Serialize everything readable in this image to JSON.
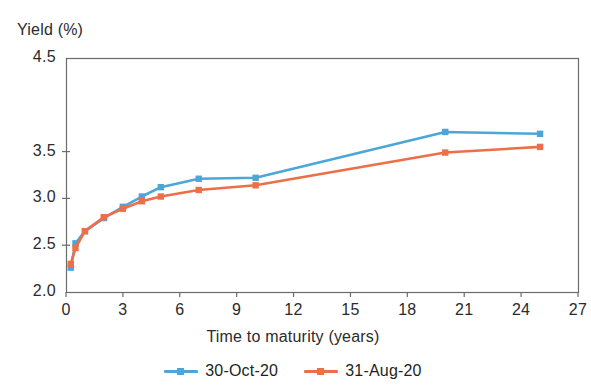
{
  "chart_data": {
    "type": "line",
    "title": "",
    "xlabel": "Time to maturity (years)",
    "ylabel": "Yield (%)",
    "xlim": [
      0,
      27
    ],
    "ylim": [
      2.0,
      4.5
    ],
    "grid": false,
    "legend_position": "bottom",
    "x_ticks": [
      "0",
      "3",
      "6",
      "9",
      "12",
      "15",
      "18",
      "21",
      "24",
      "27"
    ],
    "x_tick_values": [
      0,
      3,
      6,
      9,
      12,
      15,
      18,
      21,
      24,
      27
    ],
    "y_ticks": [
      "4.5",
      "3.5",
      "3.0",
      "2.5",
      "2.0"
    ],
    "y_tick_values": [
      4.5,
      3.5,
      3.0,
      2.5,
      2.0
    ],
    "x": [
      0.25,
      0.5,
      1,
      2,
      3,
      4,
      5,
      7,
      10,
      20,
      25
    ],
    "series": [
      {
        "name": "30-Oct-20",
        "color": "#4DA6D8",
        "marker": "square",
        "values": [
          2.26,
          2.52,
          2.65,
          2.79,
          2.91,
          3.02,
          3.12,
          3.21,
          3.22,
          3.71,
          3.69
        ]
      },
      {
        "name": "31-Aug-20",
        "color": "#ED6F47",
        "marker": "square",
        "values": [
          2.3,
          2.47,
          2.65,
          2.8,
          2.89,
          2.97,
          3.02,
          3.09,
          3.14,
          3.49,
          3.55
        ]
      }
    ]
  },
  "legend": {
    "items": [
      {
        "label": "30-Oct-20",
        "color": "#4DA6D8"
      },
      {
        "label": "31-Aug-20",
        "color": "#ED6F47"
      }
    ]
  },
  "axes": {
    "y_title": "Yield (%)",
    "x_title": "Time to maturity (years)"
  },
  "colors": {
    "series_blue": "#4DA6D8",
    "series_orange": "#ED6F47",
    "axis": "#6b6b6b",
    "text": "#231f20",
    "background": "#ffffff"
  }
}
